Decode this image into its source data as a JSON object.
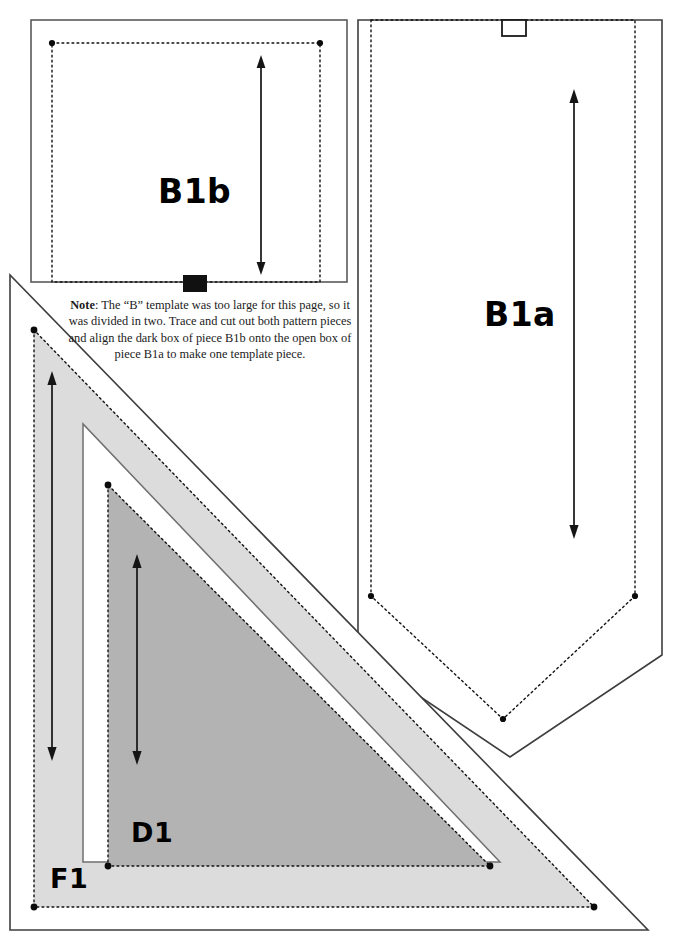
{
  "document": {
    "type": "sewing-pattern-template-sheet",
    "background_color": "#ffffff"
  },
  "pieces": [
    {
      "id": "B1b",
      "label": "B1b",
      "shape": "rectangle",
      "fill_color": "#ffffff",
      "cut_line_style": "solid",
      "stitch_line_style": "dotted",
      "grainline": "double-headed vertical arrow",
      "alignment_marker": "dark-filled-box"
    },
    {
      "id": "B1a",
      "label": "B1a",
      "shape": "pentagon-pointed-bottom",
      "fill_color": "#ffffff",
      "cut_line_style": "solid",
      "stitch_line_style": "dotted",
      "grainline": "double-headed vertical arrow",
      "alignment_marker": "open-outline-box"
    },
    {
      "id": "F1",
      "label": "F1",
      "shape": "right-triangle",
      "fill_color": "#dcdcdc",
      "cut_line_style": "solid",
      "stitch_line_style": "dotted",
      "grainline": "double-headed vertical arrow"
    },
    {
      "id": "D1",
      "label": "D1",
      "shape": "right-triangle",
      "fill_color": "#b3b3b3",
      "cut_line_style": "solid",
      "stitch_line_style": "dotted",
      "grainline": "double-headed vertical arrow"
    }
  ],
  "note": {
    "lead": "Note",
    "lead_separator": ":",
    "text": " The “B” template was too large for this page, so it was divided in two. Trace and cut out both pattern pieces and align the dark box of piece B1b onto the open box of piece B1a to make one template piece.",
    "full_text": "Note: The “B” template was too large for this page, so it was divided in two. Trace and cut out both pattern pieces and align the dark box of piece B1b onto the open box of piece B1a to make one template piece."
  },
  "colors": {
    "line": "#222222",
    "dotted": "#111111",
    "f1_fill": "#dcdcdc",
    "d1_fill": "#b3b3b3",
    "dark_box": "#111111",
    "page": "#ffffff"
  }
}
